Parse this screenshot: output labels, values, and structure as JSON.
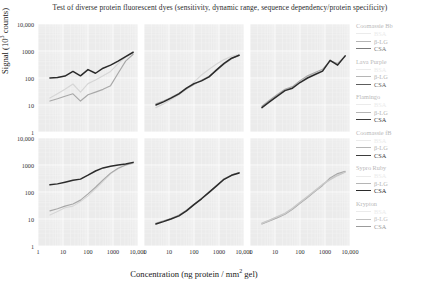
{
  "chart_data": {
    "type": "line",
    "title": "Test of diverse protein fluorescent dyes (sensitivity, dynamic range, sequence dependency/protein specificity)",
    "xlabel": "Concentration (ng protein / mm² gel)",
    "ylabel": "Signal (10³ counts)",
    "xscale": "log",
    "yscale": "log",
    "xlim": [
      1,
      10000
    ],
    "ylim": [
      1,
      10000
    ],
    "grid": true,
    "legend_position": "right",
    "xticks": [
      "1",
      "10",
      "100",
      "1000",
      "10,000"
    ],
    "yticks": [
      "1",
      "10",
      "100",
      "1000",
      "10,000"
    ],
    "series_names": [
      "BSA",
      "β-LG",
      "CSA"
    ],
    "series_colors": [
      "#d6d6d6",
      "#a8a8a8",
      "#2b2b2b"
    ],
    "panels": [
      {
        "id": "coomassie-blue",
        "name": "Coomassie Bb",
        "row": 0,
        "col": 0,
        "series": [
          {
            "name": "BSA",
            "color": "#d6d6d6",
            "x": [
              3,
              6,
              12,
              25,
              50,
              100,
              200,
              400,
              800,
              1600,
              3200,
              6400
            ],
            "y": [
              18,
              26,
              38,
              60,
              30,
              62,
              85,
              120,
              175,
              340,
              600,
              880
            ]
          },
          {
            "name": "β-LG",
            "color": "#a8a8a8",
            "x": [
              3,
              6,
              12,
              25,
              50,
              100,
              200,
              400,
              800,
              1600,
              3200,
              6400
            ],
            "y": [
              14,
              17,
              21,
              26,
              14,
              24,
              30,
              38,
              52,
              150,
              420,
              760
            ]
          },
          {
            "name": "CSA",
            "color": "#2b2b2b",
            "x": [
              3,
              6,
              12,
              25,
              50,
              100,
              200,
              400,
              800,
              1600,
              3200,
              6400
            ],
            "y": [
              100,
              104,
              118,
              175,
              120,
              205,
              150,
              230,
              300,
              420,
              620,
              900
            ]
          }
        ]
      },
      {
        "id": "lava-purple",
        "name": "Lava Purple",
        "row": 0,
        "col": 1,
        "series": [
          {
            "name": "BSA",
            "color": "#d6d6d6",
            "x": [
              3,
              6,
              12,
              25,
              50,
              100,
              200,
              400,
              800,
              1600,
              3200,
              6400
            ],
            "y": [
              8,
              11,
              16,
              24,
              38,
              70,
              130,
              210,
              330,
              480,
              640,
              760
            ]
          },
          {
            "name": "β-LG",
            "color": "#a8a8a8",
            "x": [
              3,
              6,
              12,
              25,
              50,
              100,
              200,
              400,
              800,
              1600,
              3200,
              6400
            ],
            "y": [
              11,
              14,
              19,
              27,
              40,
              58,
              82,
              115,
              190,
              330,
              520,
              700
            ]
          },
          {
            "name": "CSA",
            "color": "#2b2b2b",
            "x": [
              3,
              6,
              12,
              25,
              50,
              100,
              200,
              400,
              800,
              1600,
              3200,
              6400
            ],
            "y": [
              10,
              13,
              18,
              26,
              42,
              62,
              78,
              110,
              200,
              350,
              540,
              700
            ]
          }
        ]
      },
      {
        "id": "flamingo",
        "name": "Flamingo",
        "row": 0,
        "col": 2,
        "series": [
          {
            "name": "BSA",
            "color": "#d6d6d6",
            "x": [
              3,
              6,
              12,
              25,
              50,
              100,
              200,
              400,
              800,
              1600,
              3200,
              6400
            ],
            "y": [
              9,
              14,
              22,
              36,
              44,
              75,
              115,
              150,
              195,
              420,
              330,
              620
            ]
          },
          {
            "name": "β-LG",
            "color": "#a8a8a8",
            "x": [
              3,
              6,
              12,
              25,
              50,
              100,
              200,
              400,
              800,
              1600,
              3200,
              6400
            ],
            "y": [
              9,
              15,
              24,
              38,
              48,
              80,
              120,
              160,
              210,
              430,
              345,
              640
            ]
          },
          {
            "name": "CSA",
            "color": "#2b2b2b",
            "x": [
              3,
              6,
              12,
              25,
              50,
              100,
              200,
              400,
              800,
              1600,
              3200,
              6400
            ],
            "y": [
              8,
              13,
              21,
              34,
              42,
              68,
              100,
              135,
              180,
              450,
              300,
              660
            ]
          }
        ]
      },
      {
        "id": "coomassie-fb",
        "name": "Coomassie fB",
        "row": 1,
        "col": 0,
        "series": [
          {
            "name": "BSA",
            "color": "#d6d6d6",
            "x": [
              3,
              6,
              12,
              25,
              50,
              100,
              200,
              400,
              800,
              1600,
              3200,
              6400
            ],
            "y": [
              14,
              19,
              26,
              30,
              44,
              72,
              130,
              250,
              470,
              720,
              980,
              1150
            ]
          },
          {
            "name": "β-LG",
            "color": "#a8a8a8",
            "x": [
              3,
              6,
              12,
              25,
              50,
              100,
              200,
              400,
              800,
              1600,
              3200,
              6400
            ],
            "y": [
              20,
              24,
              30,
              36,
              50,
              85,
              150,
              280,
              500,
              760,
              1000,
              1180
            ]
          },
          {
            "name": "CSA",
            "color": "#2b2b2b",
            "x": [
              3,
              6,
              12,
              25,
              50,
              100,
              200,
              400,
              800,
              1600,
              3200,
              6400
            ],
            "y": [
              185,
              200,
              230,
              270,
              300,
              420,
              600,
              780,
              900,
              1000,
              1080,
              1250
            ]
          }
        ]
      },
      {
        "id": "sypro-ruby",
        "name": "Sypro Ruby",
        "row": 1,
        "col": 1,
        "series": [
          {
            "name": "BSA",
            "color": "#d6d6d6",
            "x": [
              3,
              6,
              12,
              25,
              50,
              100,
              200,
              400,
              800,
              1600,
              3200,
              6400
            ],
            "y": [
              7,
              8,
              10,
              13,
              20,
              33,
              55,
              95,
              170,
              300,
              420,
              520
            ]
          },
          {
            "name": "β-LG",
            "color": "#a8a8a8",
            "x": [
              3,
              6,
              12,
              25,
              50,
              100,
              200,
              400,
              800,
              1600,
              3200,
              6400
            ],
            "y": [
              7,
              8.5,
              10.5,
              14,
              21,
              35,
              58,
              100,
              175,
              310,
              430,
              530
            ]
          },
          {
            "name": "CSA",
            "color": "#2b2b2b",
            "x": [
              3,
              6,
              12,
              25,
              50,
              100,
              200,
              400,
              800,
              1600,
              3200,
              6400
            ],
            "y": [
              6.5,
              8,
              10,
              13,
              20,
              34,
              56,
              97,
              168,
              295,
              415,
              505
            ]
          }
        ]
      },
      {
        "id": "krypton",
        "name": "Krypton",
        "row": 1,
        "col": 2,
        "series": [
          {
            "name": "BSA",
            "color": "#d6d6d6",
            "x": [
              3,
              6,
              12,
              25,
              50,
              100,
              200,
              400,
              800,
              1600,
              3200,
              6400
            ],
            "y": [
              7,
              9,
              12,
              16,
              24,
              40,
              66,
              110,
              185,
              300,
              430,
              560
            ]
          },
          {
            "name": "β-LG",
            "color": "#a8a8a8",
            "x": [
              3,
              6,
              12,
              25,
              50,
              100,
              200,
              400,
              800,
              1600,
              3200,
              6400
            ],
            "y": [
              6.5,
              8.5,
              11,
              15,
              23,
              38,
              62,
              105,
              175,
              330,
              480,
              580
            ]
          },
          {
            "name": "CSA",
            "color": "#c9c9c9",
            "x": [
              3,
              6,
              12,
              25,
              50,
              100,
              200,
              400,
              800,
              1600,
              3200,
              6400
            ],
            "y": [
              7,
              9,
              12,
              16,
              25,
              41,
              68,
              112,
              190,
              290,
              410,
              545
            ]
          }
        ]
      }
    ],
    "legend": [
      {
        "title": "Coomassie Bb",
        "entries": [
          {
            "label": "BSA",
            "color": "#ebebeb"
          },
          {
            "label": "β-LG",
            "color": "#b5b5b5"
          },
          {
            "label": "CSA",
            "color": "#7a7a7a"
          }
        ]
      },
      {
        "title": "Lava Purple",
        "entries": [
          {
            "label": "BSA",
            "color": "#ebebeb"
          },
          {
            "label": "β-LG",
            "color": "#b5b5b5"
          },
          {
            "label": "CSA",
            "color": "#5d5d5d"
          }
        ]
      },
      {
        "title": "Flamingo",
        "entries": [
          {
            "label": "BSA",
            "color": "#ebebeb"
          },
          {
            "label": "β-LG",
            "color": "#b5b5b5"
          },
          {
            "label": "CSA",
            "color": "#3d3d3d"
          }
        ]
      },
      {
        "title": "Coomassie fB",
        "entries": [
          {
            "label": "BSA",
            "color": "#ebebeb"
          },
          {
            "label": "β-LG",
            "color": "#b5b5b5"
          },
          {
            "label": "CSA",
            "color": "#3d3d3d"
          }
        ]
      },
      {
        "title": "Sypro Ruby",
        "entries": [
          {
            "label": "BSA",
            "color": "#ebebeb"
          },
          {
            "label": "β-LG",
            "color": "#b5b5b5"
          },
          {
            "label": "CSA",
            "color": "#2b2b2b"
          }
        ]
      },
      {
        "title": "Krypton",
        "entries": [
          {
            "label": "BSA",
            "color": "#ebebeb"
          },
          {
            "label": "β-LG",
            "color": "#c2c2c2"
          },
          {
            "label": "CSA",
            "color": "#9b9b9b"
          }
        ]
      }
    ]
  }
}
